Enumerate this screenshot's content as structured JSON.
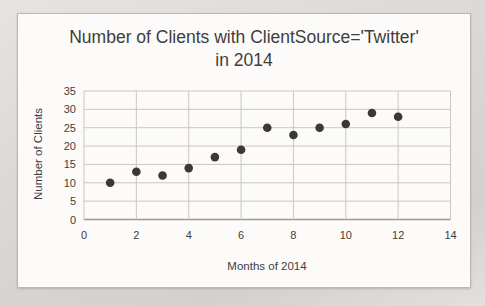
{
  "chart_data": {
    "type": "scatter",
    "title": "Number of Clients with ClientSource='Twitter' in 2014",
    "title_lines": [
      "Number of Clients with ClientSource='Twitter'",
      "in 2014"
    ],
    "xlabel": "Months of 2014",
    "ylabel": "Number of Clients",
    "x": [
      1,
      2,
      3,
      4,
      5,
      6,
      7,
      8,
      9,
      10,
      11,
      12
    ],
    "y": [
      10,
      13,
      12,
      14,
      17,
      19,
      25,
      23,
      25,
      26,
      29,
      28
    ],
    "xlim": [
      0,
      14
    ],
    "ylim": [
      0,
      35
    ],
    "xticks": [
      0,
      2,
      4,
      6,
      8,
      10,
      12,
      14
    ],
    "yticks": [
      0,
      5,
      10,
      15,
      20,
      25,
      30,
      35
    ],
    "grid": true,
    "legend": false,
    "marker": "circle",
    "colors": {
      "point": "#3a3938",
      "grid": "#c9c7c3",
      "axis": "#9a9894",
      "text": "#3f3e3c",
      "chart_background": "#fcfbf9",
      "page_background": "#dbd9d5",
      "border": "#bab8b4"
    }
  }
}
